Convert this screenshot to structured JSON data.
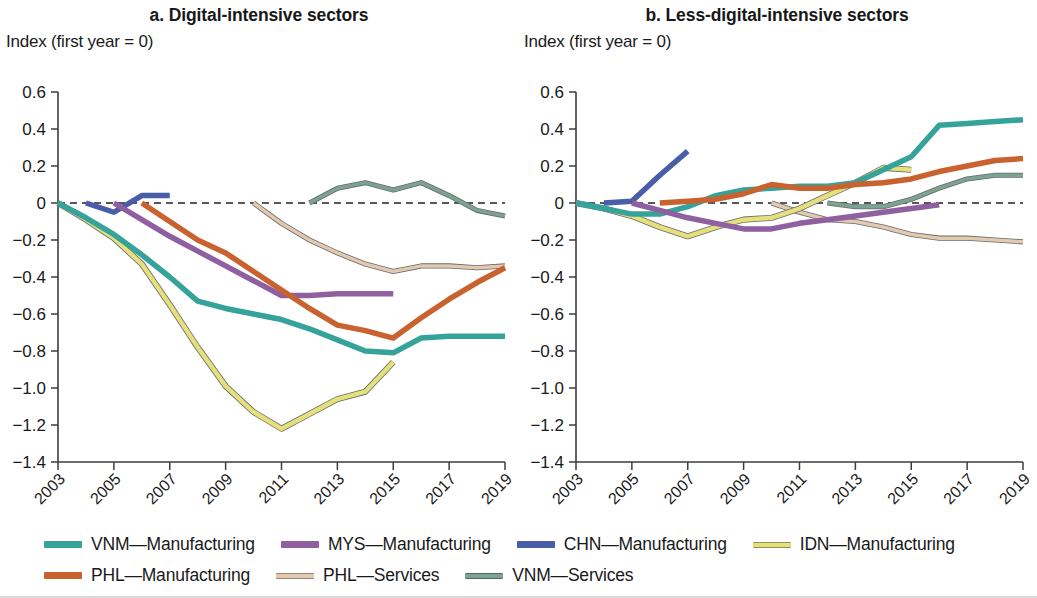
{
  "figure": {
    "y_axis_label": "Index (first year = 0)"
  },
  "panels": [
    {
      "title": "a. Digital-intensive sectors"
    },
    {
      "title": "b. Less-digital-intensive sectors"
    }
  ],
  "legend": {
    "items": [
      {
        "label": "VNM—Manufacturing",
        "color": "#36a39b",
        "style": "thick"
      },
      {
        "label": "MYS—Manufacturing",
        "color": "#8f5fa0",
        "style": "thick"
      },
      {
        "label": "CHN—Manufacturing",
        "color": "#4a5da8",
        "style": "thick"
      },
      {
        "label": "IDN—Manufacturing",
        "color": "#e5e07c",
        "style": "thin"
      },
      {
        "label": "PHL—Manufacturing",
        "color": "#c8622f",
        "style": "thick"
      },
      {
        "label": "PHL—Services",
        "color": "#e2c9b0",
        "style": "thin"
      },
      {
        "label": "VNM—Services",
        "color": "#7ba391",
        "style": "thin"
      }
    ]
  },
  "chart_data": [
    {
      "type": "line",
      "title": "a. Digital-intensive sectors",
      "xlabel": "",
      "ylabel": "Index (first year = 0)",
      "xlim": [
        2003,
        2019
      ],
      "ylim": [
        -1.4,
        0.6
      ],
      "ytick_labels": [
        "0.6",
        "0.4",
        "0.2",
        "0",
        "−0.2",
        "−0.4",
        "−0.6",
        "−0.8",
        "−1.0",
        "−1.2",
        "−1.4"
      ],
      "ytick_values": [
        0.6,
        0.4,
        0.2,
        0,
        -0.2,
        -0.4,
        -0.6,
        -0.8,
        -1.0,
        -1.2,
        -1.4
      ],
      "xtick_labels": [
        "2003",
        "2005",
        "2007",
        "2009",
        "2011",
        "2013",
        "2015",
        "2017",
        "2019"
      ],
      "xtick_values": [
        2003,
        2005,
        2007,
        2009,
        2011,
        2013,
        2015,
        2017,
        2019
      ],
      "grid": false,
      "zero_reference_line": 0,
      "legend_position": "bottom",
      "series": [
        {
          "name": "VNM—Manufacturing",
          "color": "#36a39b",
          "width": 5.5,
          "x": [
            2003,
            2004,
            2005,
            2006,
            2007,
            2008,
            2009,
            2010,
            2011,
            2012,
            2013,
            2014,
            2015,
            2016,
            2017,
            2018,
            2019
          ],
          "values": [
            0.0,
            -0.08,
            -0.17,
            -0.28,
            -0.4,
            -0.53,
            -0.57,
            -0.6,
            -0.63,
            -0.68,
            -0.74,
            -0.8,
            -0.81,
            -0.73,
            -0.72,
            -0.72,
            -0.72
          ]
        },
        {
          "name": "IDN—Manufacturing",
          "color": "#e5e07c",
          "width": 4.5,
          "x": [
            2003,
            2004,
            2005,
            2006,
            2007,
            2008,
            2009,
            2010,
            2011,
            2012,
            2013,
            2014,
            2015
          ],
          "values": [
            0.0,
            -0.09,
            -0.19,
            -0.33,
            -0.55,
            -0.78,
            -0.99,
            -1.13,
            -1.22,
            -1.14,
            -1.06,
            -1.02,
            -0.86
          ]
        },
        {
          "name": "CHN—Manufacturing",
          "color": "#4a5da8",
          "width": 5.5,
          "x": [
            2004,
            2005,
            2006,
            2007
          ],
          "values": [
            0.0,
            -0.05,
            0.04,
            0.04
          ]
        },
        {
          "name": "MYS—Manufacturing",
          "color": "#8f5fa0",
          "width": 5.5,
          "x": [
            2005,
            2006,
            2007,
            2008,
            2009,
            2010,
            2011,
            2012,
            2013,
            2014,
            2015
          ],
          "values": [
            0.0,
            -0.09,
            -0.18,
            -0.26,
            -0.34,
            -0.42,
            -0.5,
            -0.5,
            -0.49,
            -0.49,
            -0.49
          ]
        },
        {
          "name": "PHL—Manufacturing",
          "color": "#c8622f",
          "width": 5.5,
          "x": [
            2006,
            2007,
            2008,
            2009,
            2010,
            2011,
            2012,
            2013,
            2014,
            2015,
            2016,
            2017,
            2018,
            2019
          ],
          "values": [
            0.0,
            -0.1,
            -0.2,
            -0.27,
            -0.37,
            -0.47,
            -0.57,
            -0.66,
            -0.69,
            -0.73,
            -0.62,
            -0.52,
            -0.43,
            -0.35
          ]
        },
        {
          "name": "PHL—Services",
          "color": "#e2c9b0",
          "width": 3.5,
          "x": [
            2010,
            2011,
            2012,
            2013,
            2014,
            2015,
            2016,
            2017,
            2018,
            2019
          ],
          "values": [
            0.0,
            -0.11,
            -0.2,
            -0.27,
            -0.33,
            -0.37,
            -0.34,
            -0.34,
            -0.35,
            -0.34
          ]
        },
        {
          "name": "VNM—Services",
          "color": "#7ba391",
          "width": 3.5,
          "x": [
            2012,
            2013,
            2014,
            2015,
            2016,
            2017,
            2018,
            2019
          ],
          "values": [
            0.0,
            0.08,
            0.11,
            0.07,
            0.11,
            0.04,
            -0.04,
            -0.07
          ]
        }
      ]
    },
    {
      "type": "line",
      "title": "b. Less-digital-intensive sectors",
      "xlabel": "",
      "ylabel": "Index (first year = 0)",
      "xlim": [
        2003,
        2019
      ],
      "ylim": [
        -1.4,
        0.6
      ],
      "ytick_labels": [
        "0.6",
        "0.4",
        "0.2",
        "0",
        "−0.2",
        "−0.4",
        "−0.6",
        "−0.8",
        "−1.0",
        "−1.2",
        "−1.4"
      ],
      "ytick_values": [
        0.6,
        0.4,
        0.2,
        0,
        -0.2,
        -0.4,
        -0.6,
        -0.8,
        -1.0,
        -1.2,
        -1.4
      ],
      "xtick_labels": [
        "2003",
        "2005",
        "2007",
        "2009",
        "2011",
        "2013",
        "2015",
        "2017",
        "2019"
      ],
      "xtick_values": [
        2003,
        2005,
        2007,
        2009,
        2011,
        2013,
        2015,
        2017,
        2019
      ],
      "grid": false,
      "zero_reference_line": 0,
      "legend_position": "bottom",
      "series": [
        {
          "name": "VNM—Manufacturing",
          "color": "#36a39b",
          "width": 5.5,
          "x": [
            2003,
            2004,
            2005,
            2006,
            2007,
            2008,
            2009,
            2010,
            2011,
            2012,
            2013,
            2014,
            2015,
            2016,
            2017,
            2018,
            2019
          ],
          "values": [
            0.0,
            -0.03,
            -0.06,
            -0.06,
            -0.02,
            0.04,
            0.07,
            0.08,
            0.09,
            0.09,
            0.11,
            0.18,
            0.25,
            0.42,
            0.43,
            0.44,
            0.45
          ]
        },
        {
          "name": "IDN—Manufacturing",
          "color": "#e5e07c",
          "width": 4.5,
          "x": [
            2003,
            2004,
            2005,
            2006,
            2007,
            2008,
            2009,
            2010,
            2011,
            2012,
            2013,
            2014,
            2015
          ],
          "values": [
            0.0,
            -0.03,
            -0.07,
            -0.13,
            -0.18,
            -0.13,
            -0.09,
            -0.08,
            -0.03,
            0.04,
            0.11,
            0.19,
            0.18
          ]
        },
        {
          "name": "CHN—Manufacturing",
          "color": "#4a5da8",
          "width": 5.5,
          "x": [
            2004,
            2005,
            2006,
            2007
          ],
          "values": [
            0.0,
            0.01,
            0.15,
            0.28
          ]
        },
        {
          "name": "MYS—Manufacturing",
          "color": "#8f5fa0",
          "width": 5.5,
          "x": [
            2005,
            2006,
            2007,
            2008,
            2009,
            2010,
            2011,
            2012,
            2013,
            2014,
            2015,
            2016
          ],
          "values": [
            0.0,
            -0.04,
            -0.08,
            -0.11,
            -0.14,
            -0.14,
            -0.11,
            -0.09,
            -0.07,
            -0.05,
            -0.03,
            -0.01
          ]
        },
        {
          "name": "PHL—Manufacturing",
          "color": "#c8622f",
          "width": 5.5,
          "x": [
            2006,
            2007,
            2008,
            2009,
            2010,
            2011,
            2012,
            2013,
            2014,
            2015,
            2016,
            2017,
            2018,
            2019
          ],
          "values": [
            0.0,
            0.01,
            0.02,
            0.05,
            0.1,
            0.08,
            0.08,
            0.1,
            0.11,
            0.13,
            0.17,
            0.2,
            0.23,
            0.24
          ]
        },
        {
          "name": "PHL—Services",
          "color": "#e2c9b0",
          "width": 3.5,
          "x": [
            2010,
            2011,
            2012,
            2013,
            2014,
            2015,
            2016,
            2017,
            2018,
            2019
          ],
          "values": [
            0.0,
            -0.05,
            -0.09,
            -0.1,
            -0.13,
            -0.17,
            -0.19,
            -0.19,
            -0.2,
            -0.21
          ]
        },
        {
          "name": "VNM—Services",
          "color": "#7ba391",
          "width": 3.5,
          "x": [
            2012,
            2013,
            2014,
            2015,
            2016,
            2017,
            2018,
            2019
          ],
          "values": [
            0.0,
            -0.02,
            -0.02,
            0.02,
            0.08,
            0.13,
            0.15,
            0.15
          ]
        }
      ]
    }
  ]
}
